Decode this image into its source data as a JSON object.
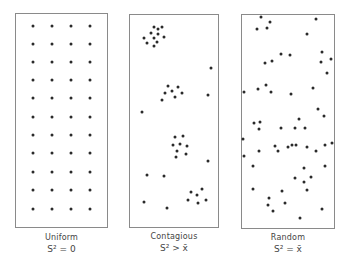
{
  "panels": [
    {
      "id": "uniform",
      "label": "Uniform",
      "formula": "S² = 0",
      "box": {
        "x": 15,
        "y": 13,
        "w": 93,
        "h": 215
      },
      "dots": [
        [
          33,
          26
        ],
        [
          52,
          26
        ],
        [
          71,
          26
        ],
        [
          90,
          26
        ],
        [
          33,
          44
        ],
        [
          52,
          44
        ],
        [
          71,
          44
        ],
        [
          90,
          44
        ],
        [
          33,
          62
        ],
        [
          52,
          62
        ],
        [
          71,
          62
        ],
        [
          90,
          62
        ],
        [
          33,
          80
        ],
        [
          52,
          80
        ],
        [
          71,
          80
        ],
        [
          90,
          80
        ],
        [
          33,
          98
        ],
        [
          52,
          98
        ],
        [
          71,
          98
        ],
        [
          90,
          98
        ],
        [
          33,
          117
        ],
        [
          52,
          117
        ],
        [
          71,
          117
        ],
        [
          90,
          117
        ],
        [
          33,
          135
        ],
        [
          52,
          135
        ],
        [
          71,
          135
        ],
        [
          90,
          135
        ],
        [
          33,
          153
        ],
        [
          52,
          153
        ],
        [
          71,
          153
        ],
        [
          90,
          153
        ],
        [
          33,
          172
        ],
        [
          52,
          172
        ],
        [
          71,
          172
        ],
        [
          90,
          172
        ],
        [
          33,
          190
        ],
        [
          52,
          190
        ],
        [
          71,
          190
        ],
        [
          90,
          190
        ],
        [
          33,
          209
        ],
        [
          52,
          209
        ],
        [
          71,
          209
        ],
        [
          90,
          209
        ]
      ]
    },
    {
      "id": "contagious",
      "label": "Contagious",
      "formula": "S² > x̄",
      "box": {
        "x": 129,
        "y": 14,
        "w": 90,
        "h": 214
      },
      "dots": [
        [
          154,
          27
        ],
        [
          158,
          29
        ],
        [
          162,
          27
        ],
        [
          151,
          33
        ],
        [
          158,
          34
        ],
        [
          144,
          38
        ],
        [
          154,
          38
        ],
        [
          164,
          37
        ],
        [
          147,
          43
        ],
        [
          157,
          42
        ],
        [
          154,
          46
        ],
        [
          211,
          68
        ],
        [
          168,
          86
        ],
        [
          178,
          87
        ],
        [
          165,
          93
        ],
        [
          172,
          91
        ],
        [
          182,
          93
        ],
        [
          175,
          97
        ],
        [
          162,
          100
        ],
        [
          208,
          95
        ],
        [
          142,
          112
        ],
        [
          175,
          137
        ],
        [
          183,
          136
        ],
        [
          173,
          145
        ],
        [
          180,
          144
        ],
        [
          187,
          146
        ],
        [
          177,
          151
        ],
        [
          186,
          154
        ],
        [
          176,
          157
        ],
        [
          208,
          161
        ],
        [
          147,
          175
        ],
        [
          164,
          176
        ],
        [
          202,
          189
        ],
        [
          191,
          192
        ],
        [
          197,
          195
        ],
        [
          188,
          200
        ],
        [
          198,
          203
        ],
        [
          206,
          200
        ],
        [
          144,
          202
        ],
        [
          167,
          208
        ]
      ]
    },
    {
      "id": "random",
      "label": "Random",
      "formula": "S² = x̄",
      "box": {
        "x": 241,
        "y": 14,
        "w": 94,
        "h": 215
      },
      "dots": [
        [
          261,
          17
        ],
        [
          270,
          22
        ],
        [
          257,
          29
        ],
        [
          267,
          28
        ],
        [
          316,
          19
        ],
        [
          307,
          34
        ],
        [
          281,
          54
        ],
        [
          290,
          55
        ],
        [
          322,
          52
        ],
        [
          331,
          59
        ],
        [
          321,
          62
        ],
        [
          265,
          63
        ],
        [
          272,
          61
        ],
        [
          327,
          73
        ],
        [
          244,
          92
        ],
        [
          258,
          89
        ],
        [
          266,
          85
        ],
        [
          271,
          92
        ],
        [
          291,
          94
        ],
        [
          313,
          88
        ],
        [
          318,
          109
        ],
        [
          324,
          116
        ],
        [
          254,
          123
        ],
        [
          260,
          122
        ],
        [
          259,
          129
        ],
        [
          281,
          128
        ],
        [
          299,
          119
        ],
        [
          295,
          128
        ],
        [
          305,
          128
        ],
        [
          243,
          139
        ],
        [
          275,
          146
        ],
        [
          278,
          151
        ],
        [
          288,
          147
        ],
        [
          292,
          145
        ],
        [
          296,
          145
        ],
        [
          307,
          147
        ],
        [
          316,
          151
        ],
        [
          325,
          145
        ],
        [
          332,
          143
        ],
        [
          244,
          156
        ],
        [
          259,
          151
        ],
        [
          253,
          166
        ],
        [
          304,
          168
        ],
        [
          325,
          166
        ],
        [
          295,
          178
        ],
        [
          311,
          177
        ],
        [
          304,
          182
        ],
        [
          253,
          189
        ],
        [
          282,
          191
        ],
        [
          307,
          190
        ],
        [
          269,
          198
        ],
        [
          268,
          205
        ],
        [
          285,
          203
        ],
        [
          273,
          211
        ],
        [
          322,
          209
        ],
        [
          300,
          218
        ]
      ]
    }
  ]
}
